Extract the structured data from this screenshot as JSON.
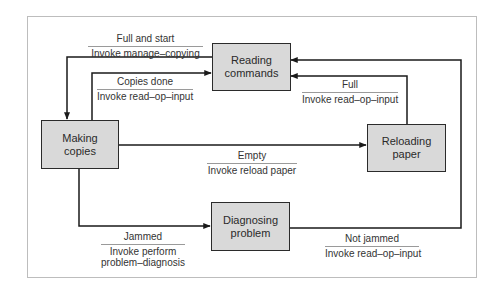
{
  "diagram": {
    "type": "state-transition",
    "colors": {
      "node_fill": "#d9d9d9",
      "node_border": "#2b2b2b",
      "line": "#1a1a1a",
      "frame": "#bdbdbd"
    },
    "nodes": {
      "reading": {
        "line1": "Reading",
        "line2": "commands"
      },
      "making": {
        "line1": "Making",
        "line2": "copies"
      },
      "reloading": {
        "line1": "Reloading",
        "line2": "paper"
      },
      "diagnosing": {
        "line1": "Diagnosing",
        "line2": "problem"
      }
    },
    "transitions": {
      "full_and_start": {
        "from": "Reading commands",
        "to": "Making copies",
        "condition": "Full and start",
        "action": "Invoke manage–copying"
      },
      "copies_done": {
        "from": "Making copies",
        "to": "Reading commands",
        "condition": "Copies done",
        "action": "Invoke read–op–input"
      },
      "full": {
        "from": "Reloading paper",
        "to": "Reading commands",
        "condition": "Full",
        "action": "Invoke read–op–input"
      },
      "empty": {
        "from": "Making copies",
        "to": "Reloading paper",
        "condition": "Empty",
        "action": "Invoke reload paper"
      },
      "jammed": {
        "from": "Making copies",
        "to": "Diagnosing problem",
        "condition": "Jammed",
        "action_line1": "Invoke perform",
        "action_line2": "problem–diagnosis"
      },
      "not_jammed": {
        "from": "Diagnosing problem",
        "to": "Reading commands",
        "condition": "Not jammed",
        "action": "Invoke read–op–input"
      }
    }
  }
}
